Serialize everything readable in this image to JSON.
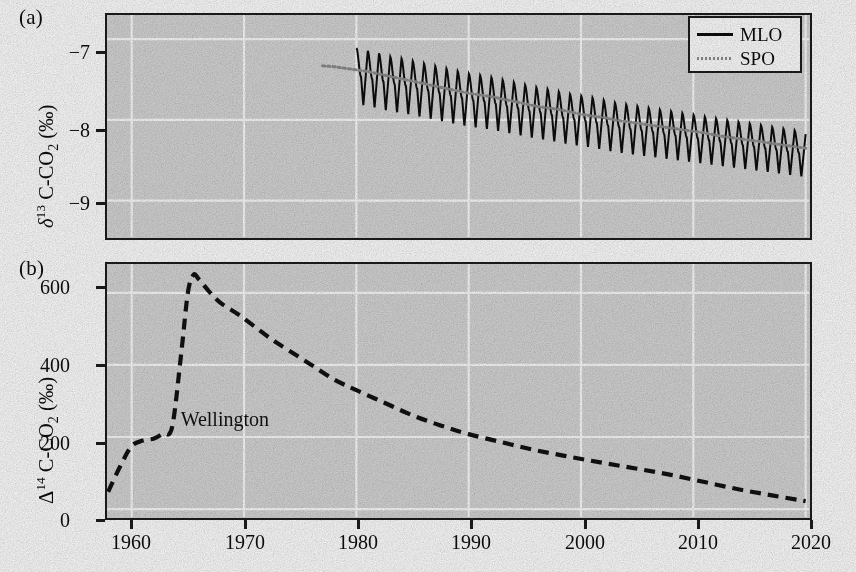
{
  "figure": {
    "background_color": "#ffffff",
    "plot_background_color": "#d6d6d6",
    "gridline_color": "#ffffff",
    "frame_color": "#1c1c1c"
  },
  "panels": {
    "a": {
      "letter": "(a)",
      "ylabel_parts": {
        "symbol": "δ",
        "superscript": "13",
        "species": " C-CO",
        "subscript": "2",
        "unit": " (‰)"
      },
      "ylabel_plain": "δ13 C-CO2 (‰)",
      "yticks": [
        "−7",
        "−8",
        "−9"
      ],
      "ytick_values": [
        -7,
        -8,
        -9
      ],
      "ylim": [
        -9.45,
        -6.7
      ],
      "xlim": [
        1957.8,
        2020.3
      ],
      "legend": {
        "position": "top-right",
        "entries": [
          {
            "label": "MLO",
            "style": "solid",
            "color": "#0d0d0d"
          },
          {
            "label": "SPO",
            "style": "dotted",
            "color": "#8d8d8d"
          }
        ]
      }
    },
    "b": {
      "letter": "(b)",
      "ylabel_parts": {
        "symbol": "Δ",
        "superscript": "14",
        "species": " C-CO",
        "subscript": "2",
        "unit": " (‰)"
      },
      "ylabel_plain": "Δ14 C-CO2 (‰)",
      "yticks": [
        "600",
        "400",
        "200",
        "0"
      ],
      "ytick_values": [
        600,
        400,
        200,
        0
      ],
      "ylim": [
        -22,
        680
      ],
      "xlim": [
        1957.8,
        2020.3
      ],
      "annotation": {
        "text": "Wellington",
        "x_year": 1964.0,
        "y_value": 250
      }
    }
  },
  "xaxis": {
    "ticks": [
      "1960",
      "1970",
      "1980",
      "1990",
      "2000",
      "2010",
      "2020"
    ],
    "tick_values": [
      1960,
      1970,
      1980,
      1990,
      2000,
      2010,
      2020
    ],
    "label": ""
  },
  "chart_data": [
    {
      "type": "line",
      "panel": "a",
      "title": "",
      "xlabel": "",
      "ylabel": "δ13 C-CO2 (‰)",
      "xlim": [
        1957.8,
        2020.3
      ],
      "ylim": [
        -9.45,
        -6.7
      ],
      "grid": true,
      "legend_position": "top-right",
      "series": [
        {
          "name": "MLO",
          "style": "solid",
          "color": "#0d0d0d",
          "comment": "Mauna Loa monthly delta-13C of CO2; strong seasonal sawtooth, annual-mean trend declining",
          "annual_mean": {
            "x": [
              1980,
              1981,
              1982,
              1983,
              1984,
              1985,
              1986,
              1987,
              1988,
              1989,
              1990,
              1991,
              1992,
              1993,
              1994,
              1995,
              1996,
              1997,
              1998,
              1999,
              2000,
              2001,
              2002,
              2003,
              2004,
              2005,
              2006,
              2007,
              2008,
              2009,
              2010,
              2011,
              2012,
              2013,
              2014,
              2015,
              2016,
              2017,
              2018,
              2019,
              2020
            ],
            "y": [
              -7.42,
              -7.45,
              -7.48,
              -7.52,
              -7.54,
              -7.57,
              -7.6,
              -7.63,
              -7.66,
              -7.69,
              -7.72,
              -7.74,
              -7.76,
              -7.79,
              -7.82,
              -7.85,
              -7.88,
              -7.9,
              -7.93,
              -7.96,
              -7.98,
              -8.0,
              -8.03,
              -8.06,
              -8.08,
              -8.1,
              -8.12,
              -8.14,
              -8.16,
              -8.18,
              -8.2,
              -8.22,
              -8.24,
              -8.26,
              -8.28,
              -8.3,
              -8.32,
              -8.34,
              -8.36,
              -8.38,
              -8.4
            ]
          },
          "seasonal_amplitude": {
            "peak_to_trough_start": 0.62,
            "peak_to_trough_end": 0.5,
            "comment": "half-amplitude of seasonal cycle; sharp downward spikes"
          }
        },
        {
          "name": "SPO",
          "style": "dotted",
          "color": "#8d8d8d",
          "comment": "South Pole delta-13C of CO2; smooth, almost no seasonal cycle",
          "x": [
            1977,
            1978,
            1979,
            1980,
            1981,
            1982,
            1983,
            1984,
            1985,
            1986,
            1987,
            1988,
            1989,
            1990,
            1991,
            1992,
            1993,
            1994,
            1995,
            1996,
            1997,
            1998,
            1999,
            2000,
            2001,
            2002,
            2003,
            2004,
            2005,
            2006,
            2007,
            2008,
            2009,
            2010,
            2011,
            2012,
            2013,
            2014,
            2015,
            2016,
            2017,
            2018,
            2019,
            2020
          ],
          "y": [
            -7.33,
            -7.34,
            -7.36,
            -7.38,
            -7.4,
            -7.43,
            -7.46,
            -7.49,
            -7.52,
            -7.55,
            -7.58,
            -7.61,
            -7.64,
            -7.67,
            -7.69,
            -7.71,
            -7.74,
            -7.77,
            -7.8,
            -7.83,
            -7.85,
            -7.87,
            -7.9,
            -7.93,
            -7.95,
            -7.97,
            -8.0,
            -8.02,
            -8.04,
            -8.06,
            -8.08,
            -8.1,
            -8.12,
            -8.14,
            -8.16,
            -8.19,
            -8.21,
            -8.23,
            -8.25,
            -8.27,
            -8.29,
            -8.31,
            -8.33,
            -8.35
          ]
        }
      ]
    },
    {
      "type": "line",
      "panel": "b",
      "title": "",
      "xlabel": "",
      "ylabel": "Δ14 C-CO2 (‰)",
      "xlim": [
        1957.8,
        2020.3
      ],
      "ylim": [
        -22,
        680
      ],
      "grid": true,
      "annotations": [
        {
          "text": "Wellington",
          "x": 1964.0,
          "y": 250
        }
      ],
      "series": [
        {
          "name": "Wellington",
          "style": "dashed",
          "color": "#111111",
          "comment": "Atmospheric bomb-radiocarbon curve: rise from 1957, peak ~1965.5 at ~650 per mille, then exponential decay to ~20 per mille by 2020",
          "x": [
            1957.9,
            1959.0,
            1960.0,
            1961.0,
            1962.0,
            1962.8,
            1963.6,
            1964.4,
            1965.0,
            1965.5,
            1966.0,
            1967.0,
            1968.0,
            1969.5,
            1971.0,
            1972.5,
            1974.0,
            1976.0,
            1978.0,
            1980.0,
            1982.5,
            1985.0,
            1987.5,
            1990.0,
            1993.0,
            1996.0,
            1999.0,
            2002.0,
            2005.0,
            2008.0,
            2011.0,
            2014.0,
            2017.0,
            2020.0
          ],
          "y": [
            48,
            120,
            175,
            190,
            196,
            210,
            228,
            430,
            600,
            650,
            637,
            600,
            570,
            540,
            505,
            470,
            440,
            400,
            360,
            330,
            295,
            260,
            232,
            208,
            185,
            163,
            145,
            128,
            112,
            95,
            75,
            55,
            38,
            22
          ]
        }
      ]
    }
  ]
}
